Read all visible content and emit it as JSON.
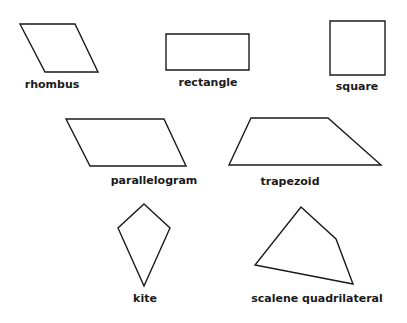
{
  "diagram": {
    "background": "#ffffff",
    "stroke_color": "#1a1a1a",
    "shapes": [
      {
        "name": "rhombus",
        "label": "rhombus",
        "points": "20,24 75,24 98,72 45,72",
        "label_x": 52,
        "label_y": 88
      },
      {
        "name": "rectangle",
        "label": "rectangle",
        "points": "166,34 249,34 249,70 166,70",
        "label_x": 208,
        "label_y": 86
      },
      {
        "name": "square",
        "label": "square",
        "points": "330,21 385,21 385,75 330,75",
        "label_x": 357,
        "label_y": 90
      },
      {
        "name": "parallelogram",
        "label": "parallelogram",
        "points": "66,119 164,119 186,166 90,166",
        "label_x": 154,
        "label_y": 184
      },
      {
        "name": "trapezoid",
        "label": "trapezoid",
        "points": "251,118 328,118 381,165 229,165",
        "label_x": 290,
        "label_y": 185
      },
      {
        "name": "kite",
        "label": "kite",
        "points": "144,204 170,228 144,286 118,228",
        "label_x": 145,
        "label_y": 302
      },
      {
        "name": "scalene-quadrilateral",
        "label": "scalene quadrilateral",
        "points": "301,207 336,239 353,284 255,265",
        "label_x": 317,
        "label_y": 302
      }
    ]
  }
}
